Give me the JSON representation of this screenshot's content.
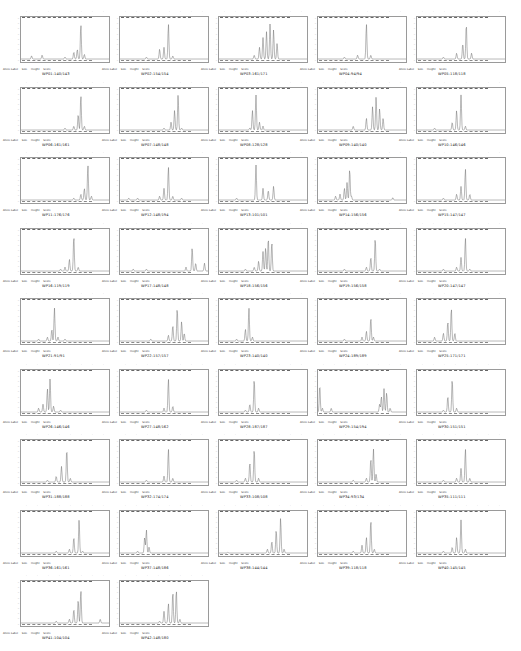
{
  "legend": {
    "allele_label": "Allele Label",
    "size": "Size",
    "height": "Height",
    "score": "Score"
  },
  "colors": {
    "trace": "#6f6f6f",
    "frame": "#9a9a9a",
    "background": "#ffffff"
  },
  "panels": [
    {
      "sample": "WP01:140/143",
      "peaks": [
        [
          0.12,
          0.08
        ],
        [
          0.24,
          0.1
        ],
        [
          0.5,
          0.05
        ],
        [
          0.6,
          0.18
        ],
        [
          0.64,
          0.25
        ],
        [
          0.68,
          0.9
        ],
        [
          0.72,
          0.12
        ]
      ]
    },
    {
      "sample": "WP02:154/154",
      "peaks": [
        [
          0.3,
          0.05
        ],
        [
          0.45,
          0.25
        ],
        [
          0.5,
          0.3
        ],
        [
          0.55,
          0.9
        ],
        [
          0.6,
          0.08
        ]
      ]
    },
    {
      "sample": "WP03:161/171",
      "peaks": [
        [
          0.4,
          0.1
        ],
        [
          0.46,
          0.3
        ],
        [
          0.5,
          0.55
        ],
        [
          0.54,
          0.7
        ],
        [
          0.58,
          0.9
        ],
        [
          0.62,
          0.75
        ],
        [
          0.66,
          0.4
        ]
      ]
    },
    {
      "sample": "WP04:94/94",
      "peaks": [
        [
          0.3,
          0.05
        ],
        [
          0.45,
          0.1
        ],
        [
          0.55,
          0.9
        ],
        [
          0.6,
          0.1
        ]
      ]
    },
    {
      "sample": "WP05:118/118",
      "peaks": [
        [
          0.3,
          0.05
        ],
        [
          0.45,
          0.15
        ],
        [
          0.52,
          0.4
        ],
        [
          0.56,
          0.9
        ],
        [
          0.62,
          0.15
        ]
      ]
    },
    {
      "sample": "WP06:161/161",
      "peaks": [
        [
          0.5,
          0.05
        ],
        [
          0.6,
          0.1
        ],
        [
          0.65,
          0.4
        ],
        [
          0.68,
          0.9
        ],
        [
          0.72,
          0.1
        ]
      ]
    },
    {
      "sample": "WP07:148/148",
      "peaks": [
        [
          0.5,
          0.05
        ],
        [
          0.58,
          0.2
        ],
        [
          0.62,
          0.5
        ],
        [
          0.66,
          0.9
        ],
        [
          0.7,
          0.05
        ]
      ]
    },
    {
      "sample": "WP08:128/128",
      "peaks": [
        [
          0.35,
          0.05
        ],
        [
          0.38,
          0.5
        ],
        [
          0.42,
          0.9
        ],
        [
          0.46,
          0.2
        ],
        [
          0.5,
          0.1
        ]
      ]
    },
    {
      "sample": "WP09:140/140",
      "peaks": [
        [
          0.4,
          0.1
        ],
        [
          0.55,
          0.3
        ],
        [
          0.62,
          0.6
        ],
        [
          0.66,
          0.85
        ],
        [
          0.7,
          0.55
        ],
        [
          0.74,
          0.3
        ]
      ]
    },
    {
      "sample": "WP10:146/146",
      "peaks": [
        [
          0.2,
          0.05
        ],
        [
          0.4,
          0.2
        ],
        [
          0.45,
          0.5
        ],
        [
          0.5,
          0.9
        ],
        [
          0.55,
          0.1
        ]
      ]
    },
    {
      "sample": "WP11:176/176",
      "peaks": [
        [
          0.6,
          0.05
        ],
        [
          0.68,
          0.15
        ],
        [
          0.72,
          0.3
        ],
        [
          0.76,
          0.9
        ],
        [
          0.8,
          0.1
        ]
      ]
    },
    {
      "sample": "WP12:148/194",
      "peaks": [
        [
          0.1,
          0.05
        ],
        [
          0.2,
          0.05
        ],
        [
          0.45,
          0.1
        ],
        [
          0.5,
          0.3
        ],
        [
          0.55,
          0.85
        ],
        [
          0.6,
          0.1
        ],
        [
          0.7,
          0.05
        ]
      ]
    },
    {
      "sample": "WP13:101/101",
      "peaks": [
        [
          0.2,
          0.05
        ],
        [
          0.42,
          0.9
        ],
        [
          0.5,
          0.3
        ],
        [
          0.56,
          0.25
        ],
        [
          0.62,
          0.35
        ]
      ]
    },
    {
      "sample": "WP14:156/156",
      "peaks": [
        [
          0.2,
          0.1
        ],
        [
          0.25,
          0.15
        ],
        [
          0.3,
          0.3
        ],
        [
          0.33,
          0.45
        ],
        [
          0.36,
          0.8
        ],
        [
          0.38,
          0.1
        ],
        [
          0.85,
          0.06
        ]
      ]
    },
    {
      "sample": "WP15:147/147",
      "peaks": [
        [
          0.3,
          0.05
        ],
        [
          0.45,
          0.15
        ],
        [
          0.5,
          0.35
        ],
        [
          0.55,
          0.8
        ],
        [
          0.6,
          0.15
        ]
      ]
    },
    {
      "sample": "WP16:119/119",
      "peaks": [
        [
          0.45,
          0.05
        ],
        [
          0.5,
          0.1
        ],
        [
          0.55,
          0.3
        ],
        [
          0.6,
          0.9
        ],
        [
          0.65,
          0.1
        ]
      ]
    },
    {
      "sample": "WP17:148/148",
      "peaks": [
        [
          0.15,
          0.05
        ],
        [
          0.3,
          0.05
        ],
        [
          0.75,
          0.1
        ],
        [
          0.82,
          0.6
        ],
        [
          0.86,
          0.2
        ],
        [
          0.96,
          0.2
        ]
      ]
    },
    {
      "sample": "WP18:156/156",
      "peaks": [
        [
          0.3,
          0.05
        ],
        [
          0.4,
          0.1
        ],
        [
          0.45,
          0.25
        ],
        [
          0.5,
          0.5
        ],
        [
          0.53,
          0.6
        ],
        [
          0.56,
          0.85
        ],
        [
          0.6,
          0.75
        ]
      ]
    },
    {
      "sample": "WP19:156/158",
      "peaks": [
        [
          0.3,
          0.05
        ],
        [
          0.55,
          0.1
        ],
        [
          0.6,
          0.35
        ],
        [
          0.65,
          0.85
        ],
        [
          0.7,
          0.05
        ]
      ]
    },
    {
      "sample": "WP20:147/147",
      "peaks": [
        [
          0.3,
          0.05
        ],
        [
          0.45,
          0.1
        ],
        [
          0.5,
          0.35
        ],
        [
          0.55,
          0.85
        ],
        [
          0.6,
          0.05
        ]
      ]
    },
    {
      "sample": "WP21:91/91",
      "peaks": [
        [
          0.2,
          0.05
        ],
        [
          0.3,
          0.1
        ],
        [
          0.35,
          0.3
        ],
        [
          0.38,
          0.85
        ],
        [
          0.42,
          0.1
        ],
        [
          0.5,
          0.05
        ]
      ]
    },
    {
      "sample": "WP22:157/157",
      "peaks": [
        [
          0.35,
          0.05
        ],
        [
          0.55,
          0.15
        ],
        [
          0.6,
          0.4
        ],
        [
          0.65,
          0.85
        ],
        [
          0.7,
          0.5
        ],
        [
          0.73,
          0.2
        ]
      ]
    },
    {
      "sample": "WP23:140/140",
      "peaks": [
        [
          0.2,
          0.05
        ],
        [
          0.3,
          0.3
        ],
        [
          0.34,
          0.85
        ],
        [
          0.38,
          0.1
        ]
      ]
    },
    {
      "sample": "WP24:189/189",
      "peaks": [
        [
          0.3,
          0.05
        ],
        [
          0.5,
          0.1
        ],
        [
          0.55,
          0.25
        ],
        [
          0.6,
          0.6
        ],
        [
          0.63,
          0.1
        ]
      ]
    },
    {
      "sample": "WP25:171/171",
      "peaks": [
        [
          0.2,
          0.1
        ],
        [
          0.3,
          0.2
        ],
        [
          0.35,
          0.5
        ],
        [
          0.39,
          0.85
        ],
        [
          0.43,
          0.2
        ]
      ]
    },
    {
      "sample": "WP26:146/146",
      "peaks": [
        [
          0.2,
          0.1
        ],
        [
          0.25,
          0.2
        ],
        [
          0.3,
          0.6
        ],
        [
          0.33,
          0.85
        ],
        [
          0.37,
          0.15
        ],
        [
          0.45,
          0.05
        ]
      ]
    },
    {
      "sample": "WP27:148/162",
      "peaks": [
        [
          0.3,
          0.05
        ],
        [
          0.5,
          0.1
        ],
        [
          0.55,
          0.85
        ],
        [
          0.6,
          0.15
        ]
      ]
    },
    {
      "sample": "WP28:187/187",
      "peaks": [
        [
          0.3,
          0.05
        ],
        [
          0.35,
          0.2
        ],
        [
          0.4,
          0.85
        ],
        [
          0.45,
          0.1
        ]
      ]
    },
    {
      "sample": "WP29:154/194",
      "peaks": [
        [
          0.02,
          0.7
        ],
        [
          0.05,
          0.1
        ],
        [
          0.15,
          0.1
        ],
        [
          0.7,
          0.2
        ],
        [
          0.72,
          0.4
        ],
        [
          0.75,
          0.6
        ],
        [
          0.78,
          0.5
        ],
        [
          0.82,
          0.1
        ]
      ]
    },
    {
      "sample": "WP30:151/151",
      "peaks": [
        [
          0.3,
          0.05
        ],
        [
          0.35,
          0.4
        ],
        [
          0.4,
          0.85
        ],
        [
          0.45,
          0.1
        ]
      ]
    },
    {
      "sample": "WP31:188/188",
      "peaks": [
        [
          0.3,
          0.05
        ],
        [
          0.4,
          0.15
        ],
        [
          0.46,
          0.4
        ],
        [
          0.52,
          0.85
        ],
        [
          0.56,
          0.1
        ]
      ]
    },
    {
      "sample": "WP32:174/174",
      "peaks": [
        [
          0.3,
          0.05
        ],
        [
          0.5,
          0.15
        ],
        [
          0.55,
          0.85
        ],
        [
          0.6,
          0.1
        ]
      ]
    },
    {
      "sample": "WP33:108/108",
      "peaks": [
        [
          0.2,
          0.05
        ],
        [
          0.3,
          0.1
        ],
        [
          0.35,
          0.5
        ],
        [
          0.4,
          0.85
        ],
        [
          0.45,
          0.1
        ]
      ]
    },
    {
      "sample": "WP34:93/134",
      "peaks": [
        [
          0.4,
          0.05
        ],
        [
          0.55,
          0.1
        ],
        [
          0.6,
          0.6
        ],
        [
          0.63,
          0.85
        ],
        [
          0.66,
          0.2
        ]
      ]
    },
    {
      "sample": "WP35:111/111",
      "peaks": [
        [
          0.3,
          0.05
        ],
        [
          0.45,
          0.1
        ],
        [
          0.5,
          0.35
        ],
        [
          0.55,
          0.85
        ],
        [
          0.6,
          0.1
        ]
      ]
    },
    {
      "sample": "WP36:161/161",
      "peaks": [
        [
          0.4,
          0.05
        ],
        [
          0.55,
          0.1
        ],
        [
          0.6,
          0.4
        ],
        [
          0.66,
          0.85
        ],
        [
          0.7,
          0.05
        ]
      ]
    },
    {
      "sample": "WP37:148/186",
      "peaks": [
        [
          0.2,
          0.05
        ],
        [
          0.28,
          0.4
        ],
        [
          0.3,
          0.6
        ],
        [
          0.33,
          0.15
        ]
      ]
    },
    {
      "sample": "WP38:144/144",
      "peaks": [
        [
          0.1,
          0.02
        ],
        [
          0.55,
          0.1
        ],
        [
          0.6,
          0.3
        ],
        [
          0.65,
          0.6
        ],
        [
          0.7,
          0.9
        ],
        [
          0.74,
          0.1
        ]
      ]
    },
    {
      "sample": "WP39:118/118",
      "peaks": [
        [
          0.4,
          0.05
        ],
        [
          0.5,
          0.2
        ],
        [
          0.55,
          0.4
        ],
        [
          0.6,
          0.85
        ],
        [
          0.64,
          0.1
        ]
      ]
    },
    {
      "sample": "WP40:145/145",
      "peaks": [
        [
          0.3,
          0.05
        ],
        [
          0.4,
          0.15
        ],
        [
          0.45,
          0.4
        ],
        [
          0.5,
          0.85
        ],
        [
          0.55,
          0.1
        ]
      ]
    },
    {
      "sample": "WP41:104/104",
      "peaks": [
        [
          0.4,
          0.05
        ],
        [
          0.55,
          0.1
        ],
        [
          0.6,
          0.35
        ],
        [
          0.65,
          0.6
        ],
        [
          0.68,
          0.85
        ],
        [
          0.9,
          0.1
        ]
      ]
    },
    {
      "sample": "WP42:148/180",
      "peaks": [
        [
          0.45,
          0.05
        ],
        [
          0.5,
          0.3
        ],
        [
          0.55,
          0.5
        ],
        [
          0.6,
          0.8
        ],
        [
          0.64,
          0.85
        ],
        [
          0.68,
          0.1
        ]
      ]
    }
  ]
}
